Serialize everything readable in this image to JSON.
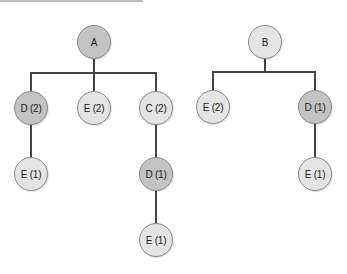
{
  "colors": {
    "dark_node": "#c3c3c3",
    "light_node": "#e4e4e4",
    "edge": "#444444"
  },
  "trees": [
    {
      "root": "A",
      "nodes": {
        "a": "A",
        "a_d2": "D (2)",
        "a_e2": "E (2)",
        "a_c2": "C (2)",
        "a_d2_e1": "E (1)",
        "a_c2_d1": "D (1)",
        "a_c2_d1_e1": "E (1)"
      }
    },
    {
      "root": "B",
      "nodes": {
        "b": "B",
        "b_e2": "E (2)",
        "b_d1": "D (1)",
        "b_d1_e1": "E (1)"
      }
    }
  ]
}
